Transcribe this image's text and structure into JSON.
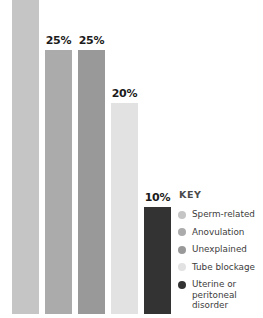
{
  "chart_data": {
    "type": "bar",
    "title": "",
    "subtitle": "",
    "xlabel": "",
    "ylabel": "",
    "ylim": [
      0,
      30
    ],
    "grid": false,
    "legend_position": "right",
    "categories": [
      "Sperm-related",
      "Anovulation",
      "Unexplained",
      "Tube blockage",
      "Uterine or peritoneal disorder"
    ],
    "values": [
      30,
      25,
      25,
      20,
      10
    ],
    "data_labels": [
      "",
      "25%",
      "25%",
      "20%",
      "10%"
    ],
    "colors": [
      "#c5c5c5",
      "#ababab",
      "#999999",
      "#e2e2e2",
      "#333333"
    ]
  },
  "bars": [
    {
      "name": "sperm-related",
      "label": "",
      "value": 30,
      "color": "#c5c5c5",
      "left_px": 12,
      "width_px": 27,
      "height_px": 318,
      "label_top_px": -20
    },
    {
      "name": "anovulation",
      "label": "25%",
      "value": 25,
      "color": "#ababab",
      "left_px": 45,
      "width_px": 27,
      "height_px": 264,
      "label_top_px": -15
    },
    {
      "name": "unexplained",
      "label": "25%",
      "value": 25,
      "color": "#999999",
      "left_px": 78,
      "width_px": 27,
      "height_px": 264,
      "label_top_px": -15
    },
    {
      "name": "tube-blockage",
      "label": "20%",
      "value": 20,
      "color": "#e2e2e2",
      "left_px": 111,
      "width_px": 27,
      "height_px": 211,
      "label_top_px": -15
    },
    {
      "name": "uterine-or-peritoneal-disorder",
      "label": "10%",
      "value": 10,
      "color": "#333333",
      "left_px": 144,
      "width_px": 27,
      "height_px": 107,
      "label_top_px": -15
    }
  ],
  "legend": {
    "title": "KEY",
    "items": [
      {
        "name": "sperm-related",
        "label": "Sperm-related",
        "color": "#c5c5c5"
      },
      {
        "name": "anovulation",
        "label": "Anovulation",
        "color": "#ababab"
      },
      {
        "name": "unexplained",
        "label": "Unexplained",
        "color": "#999999"
      },
      {
        "name": "tube-blockage",
        "label": "Tube blockage",
        "color": "#e2e2e2"
      },
      {
        "name": "uterine-or-peritoneal-disorder",
        "label": "Uterine or\nperitoneal disorder",
        "color": "#333333"
      }
    ]
  }
}
